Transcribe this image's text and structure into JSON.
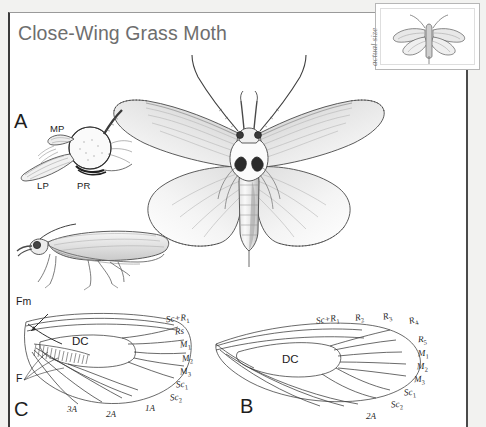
{
  "plate": {
    "title": "Close-Wing Grass Moth",
    "inset_caption": "actual size",
    "inset_icon": "moth-actual-size-icon"
  },
  "panels": [
    {
      "id": "A",
      "letter": "A",
      "name": "head-detail-panel",
      "labels": [
        {
          "text": "MP",
          "name": "label-mp-maxillary-palp"
        },
        {
          "text": "LP",
          "name": "label-lp-labial-palp"
        },
        {
          "text": "PR",
          "name": "label-pr-proboscis"
        }
      ]
    },
    {
      "id": "B",
      "letter": "B",
      "name": "hindwing-venation-panel",
      "cell": "DC",
      "veins": [
        {
          "text": "Sc+R",
          "sub": "1",
          "name": "vein-sc-r1"
        },
        {
          "text": "R",
          "sub": "2",
          "name": "vein-r2"
        },
        {
          "text": "R",
          "sub": "3",
          "name": "vein-r3"
        },
        {
          "text": "R",
          "sub": "4",
          "name": "vein-r4"
        },
        {
          "text": "R",
          "sub": "5",
          "name": "vein-r5"
        },
        {
          "text": "M",
          "sub": "1",
          "name": "vein-m1"
        },
        {
          "text": "M",
          "sub": "2",
          "name": "vein-m2"
        },
        {
          "text": "M",
          "sub": "3",
          "name": "vein-m3"
        },
        {
          "text": "Sc",
          "sub": "1",
          "name": "vein-sc1"
        },
        {
          "text": "Sc",
          "sub": "2",
          "name": "vein-sc2"
        },
        {
          "text": "2A",
          "sub": "",
          "name": "vein-2a"
        }
      ]
    },
    {
      "id": "C",
      "letter": "C",
      "name": "forewing-venation-panel",
      "cell": "DC",
      "frenulum": "F",
      "frenulum_membrane": "Fm",
      "veins": [
        {
          "text": "Sc+R",
          "sub": "1",
          "name": "vein-sc-r1"
        },
        {
          "text": "Rs",
          "sub": "",
          "name": "vein-rs"
        },
        {
          "text": "M",
          "sub": "1",
          "name": "vein-m1"
        },
        {
          "text": "M",
          "sub": "2",
          "name": "vein-m2"
        },
        {
          "text": "M",
          "sub": "3",
          "name": "vein-m3"
        },
        {
          "text": "Sc",
          "sub": "1",
          "name": "vein-sc1"
        },
        {
          "text": "Sc",
          "sub": "2",
          "name": "vein-sc2"
        },
        {
          "text": "1A",
          "sub": "",
          "name": "vein-1a"
        },
        {
          "text": "2A",
          "sub": "",
          "name": "vein-2a"
        },
        {
          "text": "3A",
          "sub": "",
          "name": "vein-3a"
        }
      ]
    }
  ],
  "figures": {
    "dorsal_moth": "moth-dorsal-spread-wings",
    "lateral_moth": "moth-lateral-view"
  },
  "colors": {
    "title": "#6e6e6e",
    "ink": "#232323",
    "frame": "#3a3a3a",
    "wing_fill": "#f2f2f2",
    "wing_shade": "#bdbdbd",
    "page": "#ffffff"
  }
}
